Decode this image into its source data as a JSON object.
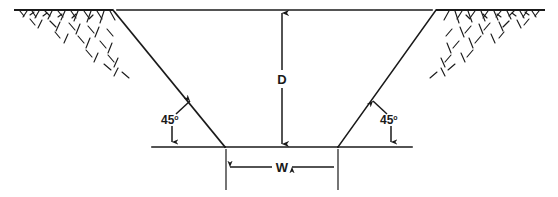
{
  "diagram": {
    "type": "engineering-cross-section",
    "background_color": "#ffffff",
    "line_color": "#1a1a1a",
    "labels": {
      "depth": "D",
      "width": "W",
      "angle_left_value": "45",
      "angle_left_degree": "o",
      "angle_right_value": "45",
      "angle_right_degree": "o"
    },
    "elements": {
      "ground_surface_left": "ground-line-left",
      "ground_surface_right": "ground-line-right",
      "top_reference_line": "top-reference-line",
      "slope_left": "excavation-slope-left",
      "slope_right": "excavation-slope-right",
      "trench_bottom": "trench-bottom-line",
      "depth_dimension": "depth-dimension-line",
      "width_dimension": "width-dimension-line",
      "hatching_left": "earth-hatching-left",
      "hatching_right": "earth-hatching-right"
    },
    "geometry": {
      "ground_level_y": 10,
      "trench_bottom_y": 147,
      "slope_top_left_x": 113,
      "slope_top_right_x": 436,
      "slope_bottom_left_x": 225,
      "slope_bottom_right_x": 338,
      "depth_axis_x": 282,
      "width_dimension_y": 167,
      "slope_angle_degrees": 45
    }
  }
}
